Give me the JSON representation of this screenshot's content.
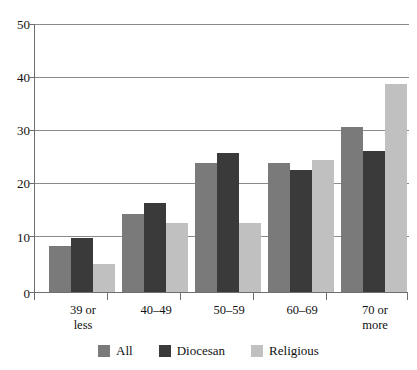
{
  "chart_data": {
    "type": "bar",
    "title": "",
    "xlabel": "",
    "ylabel": "",
    "ylim": [
      0,
      50
    ],
    "yticks": [
      0,
      10,
      20,
      30,
      40,
      50
    ],
    "ytick_labels": [
      "0",
      "10",
      "20",
      "30",
      "40",
      "50"
    ],
    "grid": true,
    "legend_position": "bottom",
    "categories": [
      "39 or less",
      "40–49",
      "50–59",
      "60–69",
      "70 or more"
    ],
    "category_lines": [
      [
        "39 or",
        "less"
      ],
      [
        "40–49",
        ""
      ],
      [
        "50–59",
        ""
      ],
      [
        "60–69",
        ""
      ],
      [
        "70 or",
        "more"
      ]
    ],
    "series": [
      {
        "name": "All",
        "color": "#7a7a7a",
        "values": [
          8.5,
          14.5,
          23.9,
          23.9,
          30.6
        ]
      },
      {
        "name": "Diocesan",
        "color": "#3a3a3a",
        "values": [
          10.1,
          16.5,
          25.8,
          22.7,
          26.2
        ]
      },
      {
        "name": "Religious",
        "color": "#c0c0c0",
        "values": [
          5.2,
          12.8,
          12.8,
          24.6,
          38.7
        ]
      }
    ]
  },
  "legend": {
    "items": [
      {
        "label": "All"
      },
      {
        "label": "Diocesan"
      },
      {
        "label": "Religious"
      }
    ]
  },
  "axis": {
    "y_labels": [
      "50",
      "40",
      "30",
      "20",
      "10",
      "0"
    ]
  }
}
